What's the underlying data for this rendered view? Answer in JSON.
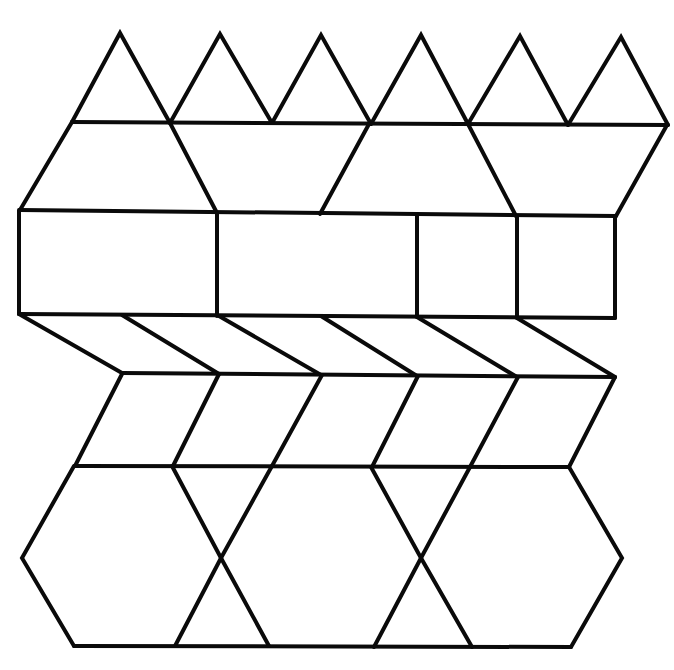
{
  "diagram": {
    "title": "Pattern block tessellation worksheet",
    "stroke_color": "#0a0a0a",
    "background_color": "#ffffff",
    "stroke_width": 4,
    "rows": [
      {
        "name": "triangles-row",
        "shape": "triangle",
        "count": 6,
        "paths": [
          [
            [
              72,
              122
            ],
            [
              120,
              33
            ],
            [
              170,
              123
            ]
          ],
          [
            [
              170,
              123
            ],
            [
              220,
              34
            ],
            [
              272,
              123
            ]
          ],
          [
            [
              272,
              123
            ],
            [
              321,
              35
            ],
            [
              371,
              124
            ]
          ],
          [
            [
              371,
              124
            ],
            [
              421,
              35
            ],
            [
              468,
              124
            ]
          ],
          [
            [
              468,
              124
            ],
            [
              520,
              36
            ],
            [
              568,
              125
            ]
          ],
          [
            [
              568,
              125
            ],
            [
              621,
              37
            ],
            [
              668,
              125
            ]
          ],
          [
            [
              72,
              122
            ],
            [
              668,
              125
            ]
          ]
        ]
      },
      {
        "name": "trapezoids-row",
        "shape": "trapezoid",
        "count": 4,
        "paths": [
          [
            [
              72,
              122
            ],
            [
              20,
              210
            ]
          ],
          [
            [
              170,
              123
            ],
            [
              217,
              213
            ]
          ],
          [
            [
              369,
              124
            ],
            [
              320,
              214
            ]
          ],
          [
            [
              468,
              124
            ],
            [
              516,
              216
            ]
          ],
          [
            [
              667,
              125
            ],
            [
              616,
              216
            ]
          ],
          [
            [
              20,
              210
            ],
            [
              616,
              216
            ]
          ]
        ]
      },
      {
        "name": "rectangles-row",
        "shape": "rectangle-and-square",
        "count": 4,
        "paths": [
          [
            [
              19,
              210
            ],
            [
              19,
              314
            ]
          ],
          [
            [
              217,
              213
            ],
            [
              217,
              316
            ]
          ],
          [
            [
              417,
              215
            ],
            [
              417,
              317
            ]
          ],
          [
            [
              517,
              216
            ],
            [
              517,
              318
            ]
          ],
          [
            [
              615,
              216
            ],
            [
              615,
              318
            ]
          ],
          [
            [
              19,
              314
            ],
            [
              615,
              318
            ]
          ]
        ]
      },
      {
        "name": "rhombi-row-upper",
        "shape": "thin-rhombus",
        "count": 6,
        "paths": [
          [
            [
              19,
              314
            ],
            [
              122,
              373
            ]
          ],
          [
            [
              122,
              315
            ],
            [
              219,
              374
            ]
          ],
          [
            [
              219,
              316
            ],
            [
              321,
              375
            ]
          ],
          [
            [
              321,
              316
            ],
            [
              417,
              376
            ]
          ],
          [
            [
              417,
              317
            ],
            [
              517,
              377
            ]
          ],
          [
            [
              517,
              318
            ],
            [
              615,
              377
            ]
          ],
          [
            [
              122,
              373
            ],
            [
              615,
              377
            ]
          ]
        ]
      },
      {
        "name": "rhombi-row-lower",
        "shape": "wide-rhombus",
        "count": 5,
        "paths": [
          [
            [
              122,
              374
            ],
            [
              75,
              466
            ]
          ],
          [
            [
              219,
              374
            ],
            [
              173,
              466
            ]
          ],
          [
            [
              322,
              375
            ],
            [
              272,
              466
            ]
          ],
          [
            [
              418,
              376
            ],
            [
              372,
              467
            ]
          ],
          [
            [
              518,
              377
            ],
            [
              470,
              467
            ]
          ],
          [
            [
              615,
              377
            ],
            [
              569,
              467
            ]
          ],
          [
            [
              75,
              466
            ],
            [
              569,
              467
            ]
          ]
        ]
      },
      {
        "name": "hexagons-row",
        "shape": "hexagon-and-triangle",
        "count": 2,
        "paths": [
          [
            [
              74,
              466
            ],
            [
              22,
              558
            ],
            [
              74,
              646
            ]
          ],
          [
            [
              172,
              466
            ],
            [
              221,
              558
            ],
            [
              269,
              646
            ]
          ],
          [
            [
              272,
              466
            ],
            [
              221,
              558
            ],
            [
              175,
              646
            ]
          ],
          [
            [
              371,
              467
            ],
            [
              421,
              558
            ],
            [
              472,
              647
            ]
          ],
          [
            [
              470,
              467
            ],
            [
              421,
              558
            ],
            [
              374,
              647
            ]
          ],
          [
            [
              569,
              467
            ],
            [
              622,
              558
            ],
            [
              571,
              647
            ]
          ],
          [
            [
              74,
              646
            ],
            [
              571,
              647
            ]
          ]
        ]
      }
    ]
  }
}
